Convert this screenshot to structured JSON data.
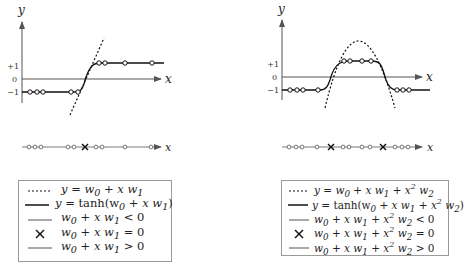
{
  "left_figure": {
    "axis_labels": {
      "y": "y",
      "x": "x"
    },
    "y_ticks": [
      "+1",
      "0",
      "−1"
    ],
    "number_line_label": "x",
    "legend": [
      {
        "key": "dotted-line",
        "label_parts": [
          "y = w",
          "0",
          " + x w",
          "1"
        ],
        "text": "y = w0 + x w1"
      },
      {
        "key": "solid-black-line",
        "text": "y = tanh(w0 + x w1)"
      },
      {
        "key": "gray-line",
        "text": "w0 + x w1 < 0"
      },
      {
        "key": "cross",
        "text": "w0 + x w1 = 0"
      },
      {
        "key": "gray-line",
        "text": "w0 + x w1 > 0"
      }
    ]
  },
  "right_figure": {
    "axis_labels": {
      "y": "y",
      "x": "x"
    },
    "y_ticks": [
      "+1",
      "0",
      "−1"
    ],
    "number_line_label": "x",
    "legend": [
      {
        "key": "dotted-line",
        "text": "y = w0 + x w1 + x^2 w2"
      },
      {
        "key": "solid-black-line",
        "text": "y = tanh(w0 + x w1 + x^2 w2)"
      },
      {
        "key": "gray-line",
        "text": "w0 + x w1 + x^2 w2 < 0"
      },
      {
        "key": "cross",
        "text": "w0 + x w1 + x^2 w2 = 0"
      },
      {
        "key": "gray-line",
        "text": "w0 + x w1 + x^2 w2 > 0"
      }
    ]
  },
  "legend_text": {
    "l0": {
      "a": "y = w",
      "s0": "0",
      "b": " + x w",
      "s1": "1"
    },
    "l1": {
      "a": "y = ",
      "fn": "tanh",
      "b": "(w",
      "s0": "0",
      "c": " + x w",
      "s1": "1",
      "d": ")"
    },
    "l2": {
      "a": "w",
      "s0": "0",
      "b": " + x w",
      "s1": "1",
      "c": " < 0"
    },
    "l3": {
      "a": "w",
      "s0": "0",
      "b": " + x w",
      "s1": "1",
      "c": " = 0"
    },
    "l4": {
      "a": "w",
      "s0": "0",
      "b": " + x w",
      "s1": "1",
      "c": " > 0"
    },
    "r0": {
      "a": "y = w",
      "s0": "0",
      "b": " + x w",
      "s1": "1",
      "c": " + x",
      "p": "2",
      "d": " w",
      "s2": "2"
    },
    "r1": {
      "a": "y = ",
      "fn": "tanh",
      "b": "(w",
      "s0": "0",
      "c": " + x w",
      "s1": "1",
      "d": " + x",
      "p": "2",
      "e": " w",
      "s2": "2",
      "f": ")"
    },
    "r2": {
      "a": "w",
      "s0": "0",
      "b": " + x w",
      "s1": "1",
      "c": " + x",
      "p": "2",
      "d": " w",
      "s2": "2",
      "e": " < 0"
    },
    "r3": {
      "a": "w",
      "s0": "0",
      "b": " + x w",
      "s1": "1",
      "c": " + x",
      "p": "2",
      "d": " w",
      "s2": "2",
      "e": " = 0"
    },
    "r4": {
      "a": "w",
      "s0": "0",
      "b": " + x w",
      "s1": "1",
      "c": " + x",
      "p": "2",
      "d": " w",
      "s2": "2",
      "e": " > 0"
    }
  },
  "colors": {
    "curve": "#111111",
    "axis": "#555555",
    "gray_line": "#7a7a7a",
    "legend_border": "#9a9a9a"
  }
}
